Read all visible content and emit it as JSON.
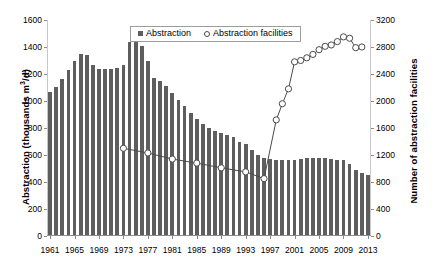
{
  "chart_data": {
    "type": "bar",
    "title": "",
    "xlabel": "",
    "ylabel": "Abstraction (thousands m3/d)",
    "ylabel_prefix": "Abstraction (thousands m",
    "ylabel_sup": "3",
    "ylabel_suffix": "/d)",
    "y2label": "Number of abstraction facilities",
    "ylim": [
      0,
      1600
    ],
    "y2lim": [
      0,
      3200
    ],
    "ytick_labels": [
      "0",
      "200",
      "400",
      "600",
      "800",
      "1000",
      "1200",
      "1400",
      "1600"
    ],
    "yticks": [
      0,
      200,
      400,
      600,
      800,
      1000,
      1200,
      1400,
      1600
    ],
    "y2tick_labels": [
      "0",
      "400",
      "800",
      "1200",
      "1600",
      "2000",
      "2400",
      "2800",
      "3200"
    ],
    "y2ticks": [
      0,
      400,
      800,
      1200,
      1600,
      2000,
      2400,
      2800,
      3200
    ],
    "xtick_labels": [
      "1961",
      "1965",
      "1969",
      "1973",
      "1977",
      "1981",
      "1985",
      "1989",
      "1993",
      "1997",
      "2001",
      "2005",
      "2009",
      "2013"
    ],
    "xticks": [
      1961,
      1965,
      1969,
      1973,
      1977,
      1981,
      1985,
      1989,
      1993,
      1997,
      2001,
      2005,
      2009,
      2013
    ],
    "grid": false,
    "legend_position": "top-center",
    "categories": [
      1961,
      1962,
      1963,
      1964,
      1965,
      1966,
      1967,
      1968,
      1969,
      1970,
      1971,
      1972,
      1973,
      1974,
      1975,
      1976,
      1977,
      1978,
      1979,
      1980,
      1981,
      1982,
      1983,
      1984,
      1985,
      1986,
      1987,
      1988,
      1989,
      1990,
      1991,
      1992,
      1993,
      1994,
      1995,
      1996,
      1997,
      1998,
      1999,
      2000,
      2001,
      2002,
      2003,
      2004,
      2005,
      2006,
      2007,
      2008,
      2009,
      2010,
      2011,
      2012,
      2013
    ],
    "series": [
      {
        "name": "Abstraction",
        "kind": "bar",
        "axis": "left",
        "color": "#5e5e5e",
        "units": "thousands m3/d",
        "values": [
          1070,
          1105,
          1160,
          1230,
          1300,
          1345,
          1340,
          1265,
          1240,
          1240,
          1240,
          1245,
          1265,
          1440,
          1490,
          1410,
          1300,
          1170,
          1150,
          1110,
          1060,
          1010,
          960,
          910,
          870,
          830,
          800,
          780,
          760,
          745,
          730,
          700,
          680,
          640,
          600,
          575,
          570,
          565,
          565,
          565,
          565,
          570,
          575,
          580,
          580,
          575,
          570,
          565,
          560,
          530,
          490,
          465,
          450
        ]
      },
      {
        "name": "Abstraction facilities",
        "kind": "line",
        "axis": "right",
        "marker": "open-circle",
        "color": "#4a4a4a",
        "units": "facilities",
        "x": [
          1973,
          1977,
          1981,
          1985,
          1989,
          1993,
          1996,
          1998,
          1999,
          2000,
          2001,
          2002,
          2003,
          2004,
          2005,
          2006,
          2007,
          2008,
          2009,
          2010,
          2011,
          2012
        ],
        "values": [
          1300,
          1230,
          1140,
          1080,
          1010,
          950,
          850,
          1720,
          1960,
          2180,
          2580,
          2600,
          2640,
          2690,
          2760,
          2810,
          2830,
          2880,
          2950,
          2930,
          2790,
          2800
        ]
      }
    ],
    "legend": [
      {
        "label": "Abstraction",
        "marker": "filled-square",
        "color": "#5e5e5e"
      },
      {
        "label": "Abstraction facilities",
        "marker": "open-circle",
        "color": "#4a4a4a"
      }
    ]
  }
}
